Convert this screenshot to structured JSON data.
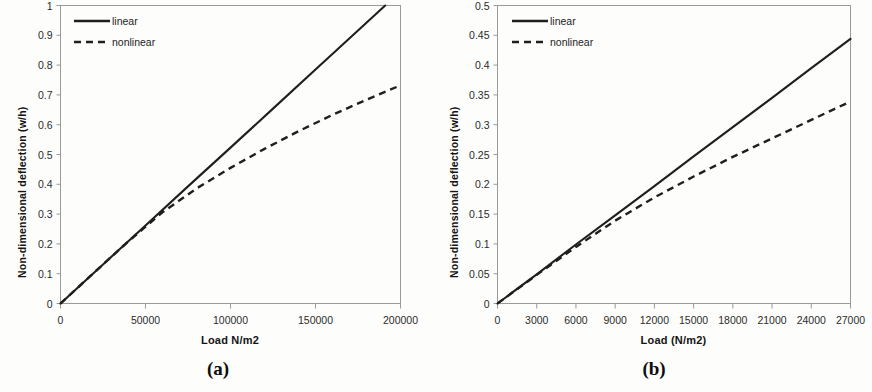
{
  "figure": {
    "panels": [
      {
        "id": "a",
        "caption": "(a)",
        "ylabel": "Non-dimensional deflection (w/h)",
        "xlabel": "Load N/m2",
        "legend": {
          "linear": "linear",
          "nonlinear": "nonlinear"
        },
        "yticks": [
          "0",
          "0.1",
          "0.2",
          "0.3",
          "0.4",
          "0.5",
          "0.6",
          "0.7",
          "0.8",
          "0.9",
          "1"
        ],
        "xticks": [
          "0",
          "50000",
          "100000",
          "150000",
          "200000"
        ]
      },
      {
        "id": "b",
        "caption": "(b)",
        "ylabel": "Non-dimensional deflection (w/h)",
        "xlabel": "Load (N/m2)",
        "legend": {
          "linear": "linear",
          "nonlinear": "nonlinear"
        },
        "yticks": [
          "0",
          "0.05",
          "0.1",
          "0.15",
          "0.2",
          "0.25",
          "0.3",
          "0.35",
          "0.4",
          "0.45",
          "0.5"
        ],
        "xticks": [
          "0",
          "3000",
          "6000",
          "9000",
          "12000",
          "15000",
          "18000",
          "21000",
          "24000",
          "27000"
        ]
      }
    ],
    "colors": {
      "line": "#1f1f1f",
      "axis": "#8c8c8c",
      "text": "#1a1a1a"
    }
  },
  "chart_data": [
    {
      "type": "line",
      "title": "(a)",
      "xlabel": "Load N/m2",
      "ylabel": "Non-dimensional deflection (w/h)",
      "xlim": [
        0,
        200000
      ],
      "ylim": [
        0,
        1
      ],
      "xticks": [
        0,
        50000,
        100000,
        150000,
        200000
      ],
      "yticks": [
        0,
        0.1,
        0.2,
        0.3,
        0.4,
        0.5,
        0.6,
        0.7,
        0.8,
        0.9,
        1
      ],
      "grid": false,
      "legend_position": "top-left",
      "series": [
        {
          "name": "linear",
          "style": "solid",
          "x": [
            0,
            25000,
            50000,
            75000,
            100000,
            125000,
            150000,
            175000,
            191000
          ],
          "values": [
            0,
            0.131,
            0.262,
            0.393,
            0.523,
            0.654,
            0.785,
            0.916,
            1.0
          ]
        },
        {
          "name": "nonlinear",
          "style": "dashed",
          "x": [
            0,
            20000,
            40000,
            60000,
            80000,
            100000,
            120000,
            140000,
            160000,
            180000,
            200000
          ],
          "values": [
            0,
            0.105,
            0.209,
            0.306,
            0.386,
            0.455,
            0.519,
            0.578,
            0.633,
            0.684,
            0.732
          ]
        }
      ]
    },
    {
      "type": "line",
      "title": "(b)",
      "xlabel": "Load (N/m2)",
      "ylabel": "Non-dimensional deflection (w/h)",
      "xlim": [
        0,
        27000
      ],
      "ylim": [
        0,
        0.5
      ],
      "xticks": [
        0,
        3000,
        6000,
        9000,
        12000,
        15000,
        18000,
        21000,
        24000,
        27000
      ],
      "yticks": [
        0,
        0.05,
        0.1,
        0.15,
        0.2,
        0.25,
        0.3,
        0.35,
        0.4,
        0.45,
        0.5
      ],
      "grid": false,
      "legend_position": "top-left",
      "series": [
        {
          "name": "linear",
          "style": "solid",
          "x": [
            0,
            3000,
            6000,
            9000,
            12000,
            15000,
            18000,
            21000,
            24000,
            27000
          ],
          "values": [
            0,
            0.049,
            0.099,
            0.148,
            0.197,
            0.247,
            0.296,
            0.345,
            0.395,
            0.444
          ]
        },
        {
          "name": "nonlinear",
          "style": "dashed",
          "x": [
            0,
            3000,
            6000,
            9000,
            12000,
            15000,
            18000,
            21000,
            24000,
            27000
          ],
          "values": [
            0,
            0.048,
            0.095,
            0.139,
            0.178,
            0.213,
            0.246,
            0.277,
            0.308,
            0.339
          ]
        }
      ]
    }
  ]
}
